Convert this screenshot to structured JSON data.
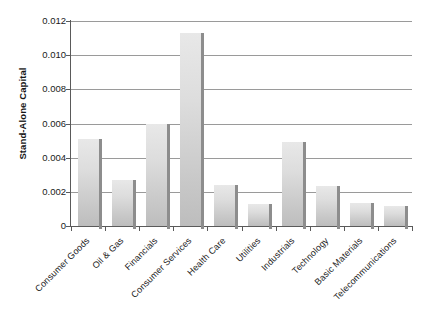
{
  "chart_data": {
    "type": "bar",
    "title": "",
    "xlabel": "",
    "ylabel": "Stand-Alone Capital",
    "ylim": [
      0,
      0.012
    ],
    "ytick_labels": [
      "0.012",
      "0.010",
      "0.008",
      "0.006",
      "0.004",
      "0.002",
      "0"
    ],
    "ytick_values": [
      0.012,
      0.01,
      0.008,
      0.006,
      0.004,
      0.002,
      0
    ],
    "grid": true,
    "legend": null,
    "categories": [
      "Consumer Goods",
      "Oil & Gas",
      "Financials",
      "Consumer Services",
      "Health Care",
      "Utilities",
      "Industrials",
      "Technology",
      "Basic Materials",
      "Telecommunications"
    ],
    "values": [
      0.00512,
      0.0027,
      0.00598,
      0.01128,
      0.0024,
      0.00128,
      0.00492,
      0.00232,
      0.00134,
      0.00116
    ],
    "bar_color": "#d9d9d9",
    "bar_edge_color": "#8d8d8d",
    "axis_color": "#5a5a5a",
    "grid_color": "#9a9a9a",
    "background_color": "#ffffff"
  }
}
